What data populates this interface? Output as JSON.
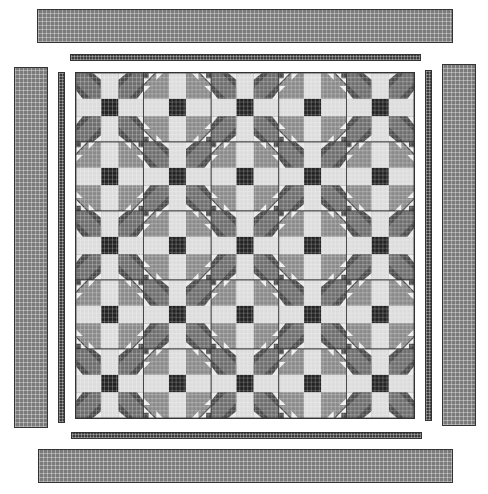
{
  "diagram": {
    "type": "quilt-layout",
    "grid": {
      "rows": 5,
      "cols": 5
    },
    "layout": [
      [
        "A",
        "B",
        "A",
        "B",
        "A"
      ],
      [
        "B",
        "A",
        "B",
        "A",
        "B"
      ],
      [
        "A",
        "B",
        "A",
        "B",
        "A"
      ],
      [
        "B",
        "A",
        "B",
        "A",
        "B"
      ],
      [
        "A",
        "B",
        "A",
        "B",
        "A"
      ]
    ],
    "blocks": {
      "A": {
        "name": "dark-star-cross-block",
        "center": "#222222",
        "cross": "#dcdcdc",
        "corner_dark": "#4a4a4a",
        "corner_mid": "#6e6e6e",
        "accent_light": "#e8e8e8"
      },
      "B": {
        "name": "light-star-cross-block",
        "center": "#222222",
        "cross": "#dcdcdc",
        "corner_mid": "#8a8a8a",
        "corner_dark": "#4a4a4a",
        "accent_light": "#eeeeee"
      }
    },
    "borders": {
      "outer": {
        "color": "#7a7a7a",
        "pieces": [
          "top",
          "bottom",
          "left",
          "right"
        ]
      },
      "inner": {
        "color": "#3c3c3c",
        "pieces": [
          "top",
          "bottom",
          "left",
          "right"
        ]
      }
    },
    "colors": {
      "background": "#ffffff",
      "outline": "#333333"
    }
  }
}
